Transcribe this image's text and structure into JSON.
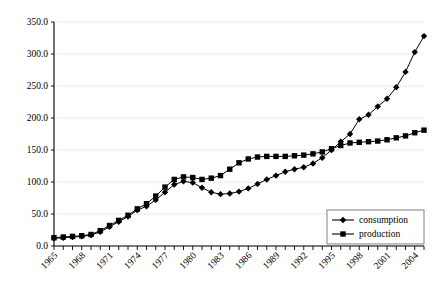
{
  "chart_data": {
    "type": "line",
    "title": "",
    "subtitle": "",
    "xlabel": "",
    "ylabel": "",
    "ylim": [
      0,
      350
    ],
    "yticks": [
      0,
      50,
      100,
      150,
      200,
      250,
      300,
      350
    ],
    "ytick_labels": [
      "0.0",
      "50.0",
      "100.0",
      "150.0",
      "200.0",
      "250.0",
      "300.0",
      "350.0"
    ],
    "grid": true,
    "grid_color": "#cccccc",
    "legend_position": "bottom-right",
    "x": [
      1965,
      1966,
      1967,
      1968,
      1969,
      1970,
      1971,
      1972,
      1973,
      1974,
      1975,
      1976,
      1977,
      1978,
      1979,
      1980,
      1981,
      1982,
      1983,
      1984,
      1985,
      1986,
      1987,
      1988,
      1989,
      1990,
      1991,
      1992,
      1993,
      1994,
      1995,
      1996,
      1997,
      1998,
      1999,
      2000,
      2001,
      2002,
      2003,
      2004,
      2005
    ],
    "xtick_labels": [
      "1965",
      "1968",
      "1971",
      "1974",
      "1977",
      "1980",
      "1983",
      "1986",
      "1989",
      "1992",
      "1995",
      "1998",
      "2001",
      "2004"
    ],
    "xtick_label_years": [
      1965,
      1968,
      1971,
      1974,
      1977,
      1980,
      1983,
      1986,
      1989,
      1992,
      1995,
      1998,
      2001,
      2004
    ],
    "series": [
      {
        "name": "consumption",
        "marker": "diamond",
        "color": "#000000",
        "values": [
          12,
          13,
          14,
          15,
          17,
          22,
          30,
          38,
          46,
          56,
          62,
          72,
          84,
          96,
          101,
          99,
          91,
          84,
          81,
          82,
          85,
          90,
          97,
          104,
          110,
          116,
          120,
          123,
          129,
          138,
          150,
          163,
          175,
          198,
          205,
          218,
          230,
          248,
          272,
          303,
          328
        ]
      },
      {
        "name": "production",
        "marker": "square",
        "color": "#000000",
        "values": [
          13,
          14,
          15,
          16,
          18,
          24,
          32,
          40,
          48,
          58,
          66,
          78,
          92,
          104,
          108,
          107,
          104,
          106,
          110,
          120,
          130,
          136,
          139,
          140,
          140,
          140,
          141,
          142,
          144,
          147,
          152,
          157,
          161,
          162,
          163,
          164,
          166,
          169,
          172,
          177,
          181
        ]
      }
    ]
  },
  "legend": {
    "items": [
      {
        "label": "consumption",
        "marker": "diamond"
      },
      {
        "label": "production",
        "marker": "square"
      }
    ]
  }
}
